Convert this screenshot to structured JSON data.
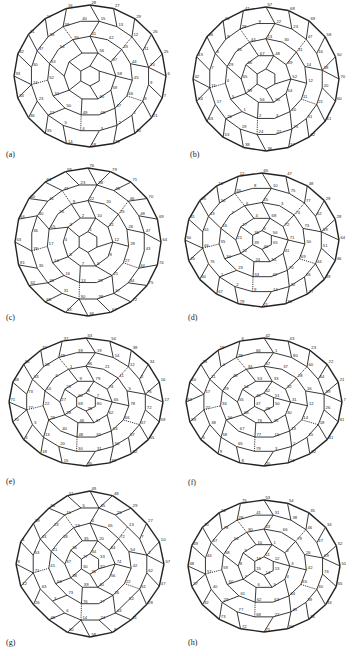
{
  "figure": {
    "panels": [
      {
        "label": "(a)",
        "shape": "round",
        "sample_vertex_labels": [
          "28",
          "27",
          "29",
          "26",
          "25",
          "6",
          "7",
          "21",
          "20",
          "19",
          "18",
          "14",
          "35",
          "36",
          "34",
          "33",
          "32",
          "31",
          "17",
          "16",
          "15",
          "13",
          "12",
          "11",
          "10",
          "9",
          "8",
          "1",
          "2",
          "3",
          "4",
          "5",
          "22",
          "23",
          "24",
          "30",
          "37",
          "38",
          "39",
          "40",
          "41",
          "42",
          "43",
          "44",
          "45",
          "46",
          "47",
          "48",
          "49",
          "50",
          "51",
          "52",
          "53",
          "54",
          "55",
          "56",
          "57",
          "58",
          "59",
          "60"
        ]
      },
      {
        "label": "(b)",
        "shape": "round",
        "sample_vertex_labels": [
          "57",
          "68",
          "69",
          "58",
          "50",
          "70",
          "60",
          "61",
          "62",
          "37",
          "36",
          "38",
          "53",
          "63",
          "64",
          "42",
          "43",
          "46",
          "40",
          "41",
          "22",
          "23",
          "47",
          "16",
          "18",
          "20",
          "21",
          "51",
          "25",
          "27",
          "24",
          "19",
          "26",
          "17",
          "15",
          "7",
          "6",
          "8",
          "28",
          "9",
          "13",
          "30",
          "31",
          "14",
          "12",
          "11",
          "10",
          "3",
          "2",
          "1",
          "5",
          "4",
          "29",
          "45",
          "44",
          "48",
          "49",
          "52",
          "54",
          "55",
          "56",
          "59",
          "65",
          "66",
          "67"
        ]
      },
      {
        "label": "(c)",
        "shape": "round",
        "sample_vertex_labels": [
          "76",
          "79",
          "71",
          "70",
          "69",
          "64",
          "74",
          "75",
          "72",
          "67",
          "66",
          "53",
          "65",
          "62",
          "81",
          "63",
          "56",
          "60",
          "61",
          "59",
          "58",
          "45",
          "46",
          "48",
          "47",
          "43",
          "44",
          "34",
          "37",
          "38",
          "30",
          "31",
          "33",
          "35",
          "39",
          "36",
          "40",
          "41",
          "42",
          "23",
          "22",
          "20",
          "25",
          "26",
          "28",
          "27",
          "21",
          "19",
          "13",
          "16",
          "14",
          "17",
          "15",
          "24",
          "9",
          "10",
          "11",
          "12",
          "8",
          "6",
          "7",
          "5",
          "4",
          "3",
          "2",
          "1"
        ]
      },
      {
        "label": "(d)",
        "shape": "oval",
        "sample_vertex_labels": [
          "65",
          "47",
          "48",
          "29",
          "28",
          "64",
          "46",
          "49",
          "27",
          "30",
          "11",
          "79",
          "67",
          "60",
          "45",
          "50",
          "31",
          "25",
          "13",
          "12",
          "10",
          "75",
          "77",
          "62",
          "59",
          "51",
          "44",
          "26",
          "32",
          "14",
          "9",
          "2",
          "1",
          "76",
          "66",
          "61",
          "43",
          "52",
          "33",
          "8",
          "15",
          "3",
          "74",
          "73",
          "50",
          "69",
          "70",
          "42",
          "53",
          "23",
          "34",
          "35",
          "16",
          "7",
          "6",
          "68",
          "72",
          "71",
          "41",
          "54",
          "24",
          "22",
          "21",
          "17",
          "4",
          "5",
          "56",
          "55",
          "40",
          "39",
          "36",
          "37",
          "18",
          "19",
          "20",
          "57",
          "58",
          "38"
        ]
      },
      {
        "label": "(e)",
        "shape": "oval",
        "sample_vertex_labels": [
          "53",
          "54",
          "38",
          "34",
          "16",
          "17",
          "59",
          "55",
          "52",
          "33",
          "35",
          "15",
          "18",
          "4",
          "70",
          "71",
          "68",
          "51",
          "32",
          "37",
          "19",
          "14",
          "12",
          "2",
          "76",
          "72",
          "67",
          "57",
          "50",
          "31",
          "30",
          "20",
          "13",
          "3",
          "77",
          "73",
          "63",
          "58",
          "49",
          "39",
          "36",
          "21",
          "11",
          "5",
          "78",
          "66",
          "64",
          "61",
          "48",
          "40",
          "29",
          "22",
          "10",
          "6",
          "1",
          "79",
          "74",
          "65",
          "62",
          "47",
          "46",
          "28",
          "27",
          "23",
          "9",
          "8",
          "7",
          "80",
          "75",
          "69",
          "60",
          "45",
          "44",
          "43",
          "42",
          "41",
          "26",
          "25",
          "24"
        ]
      },
      {
        "label": "(f)",
        "shape": "oval",
        "sample_vertex_labels": [
          "42",
          "43",
          "23",
          "22",
          "21",
          "7",
          "61",
          "41",
          "62",
          "24",
          "20",
          "8",
          "9",
          "5",
          "59",
          "63",
          "40",
          "25",
          "19",
          "6",
          "1",
          "80",
          "60",
          "64",
          "39",
          "26",
          "18",
          "10",
          "2",
          "3",
          "79",
          "65",
          "58",
          "38",
          "27",
          "17",
          "11",
          "4",
          "78",
          "66",
          "57",
          "37",
          "28",
          "16",
          "12",
          "14",
          "13",
          "15",
          "77",
          "67",
          "56",
          "36",
          "29",
          "48",
          "34",
          "33",
          "32",
          "31",
          "30",
          "35",
          "76",
          "68",
          "55",
          "54",
          "53",
          "52",
          "51",
          "50",
          "49",
          "47",
          "46",
          "45",
          "44",
          "69",
          "70",
          "71",
          "72",
          "73",
          "74",
          "75"
        ]
      },
      {
        "label": "(g)",
        "shape": "rounded-square",
        "sample_vertex_labels": [
          "49",
          "48",
          "29",
          "27",
          "10",
          "57",
          "47",
          "28",
          "11",
          "9",
          "58",
          "50",
          "46",
          "26",
          "12",
          "8",
          "1",
          "59",
          "60",
          "51",
          "45",
          "25",
          "13",
          "7",
          "2",
          "62",
          "61",
          "52",
          "44",
          "24",
          "14",
          "6",
          "3",
          "63",
          "71",
          "53",
          "43",
          "23",
          "15",
          "5",
          "4",
          "65",
          "72",
          "54",
          "42",
          "22",
          "16",
          "17",
          "76",
          "73",
          "55",
          "41",
          "21",
          "18",
          "19",
          "20",
          "64",
          "74",
          "56",
          "40",
          "39",
          "38",
          "37",
          "36",
          "35",
          "34",
          "33",
          "32",
          "31",
          "30",
          "77",
          "78",
          "75",
          "79",
          "80",
          "66",
          "67",
          "68",
          "69",
          "70"
        ]
      },
      {
        "label": "(h)",
        "shape": "round",
        "sample_vertex_labels": [
          "53",
          "54",
          "35",
          "34",
          "52",
          "51",
          "55",
          "33",
          "36",
          "50",
          "71",
          "72",
          "73",
          "32",
          "37",
          "48",
          "49",
          "70",
          "74",
          "75",
          "31",
          "38",
          "46",
          "47",
          "69",
          "76",
          "30",
          "39",
          "45",
          "27",
          "68",
          "77",
          "29",
          "40",
          "57",
          "44",
          "67",
          "78",
          "28",
          "41",
          "43",
          "66",
          "79",
          "26",
          "42",
          "65",
          "64",
          "63",
          "62",
          "61",
          "60",
          "59",
          "58",
          "56",
          "80",
          "1",
          "2",
          "3",
          "4",
          "5",
          "6",
          "7",
          "8",
          "9",
          "10",
          "11",
          "12",
          "13",
          "14",
          "15",
          "16",
          "17",
          "18",
          "19",
          "20",
          "21",
          "22",
          "23",
          "24",
          "25"
        ]
      }
    ]
  }
}
